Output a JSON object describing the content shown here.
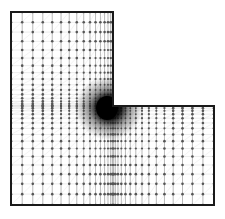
{
  "diagram": {
    "type": "finite-element-mesh",
    "shape": "L-shaped domain",
    "outline_points": [
      [
        11,
        12
      ],
      [
        113,
        12
      ],
      [
        113,
        106
      ],
      [
        214,
        106
      ],
      [
        214,
        205
      ],
      [
        11,
        205
      ]
    ],
    "reentrant_corner": [
      113,
      106
    ],
    "refinement": "mesh graded toward re-entrant corner",
    "colors": {
      "background": "#ffffff",
      "outline": "#1a1a1a",
      "mesh_line": "#8a8a8a",
      "node": "#555555",
      "dense_region": "#000000"
    }
  }
}
